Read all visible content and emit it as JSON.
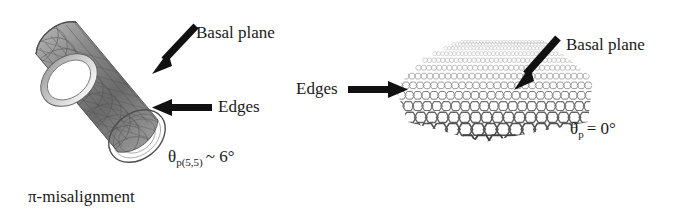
{
  "figure": {
    "background_color": "#ffffff",
    "text_color": "#1a1a1a",
    "structure_color": "#6f6f6f",
    "arrow_color": "#111111"
  },
  "left_panel": {
    "name": "carbon-nanotube-illustration",
    "structure_type": "armchair carbon nanotube (5,5) drawn as a tilted hollow cylinder with hexagonal lattice",
    "labels": {
      "basal_plane": "Basal plane",
      "edges": "Edges",
      "theta_symbol": "θ",
      "theta_subscript": "p(5,5)",
      "theta_relation": "~ 6°",
      "theta_full": "θp(5,5) ~ 6°",
      "caption": "π-misalignment"
    },
    "arrows": [
      {
        "name": "basal-plane-arrow",
        "direction": "down-left",
        "points_to": "tube wall"
      },
      {
        "name": "edges-arrow",
        "direction": "left",
        "points_to": "tube open rim"
      }
    ]
  },
  "right_panel": {
    "name": "graphene-sheet-illustration",
    "structure_type": "single graphene sheet in perspective with hexagonal lattice",
    "labels": {
      "basal_plane": "Basal plane",
      "edges": "Edges",
      "theta_symbol": "θ",
      "theta_subscript": "p",
      "theta_relation": "= 0°",
      "theta_full": "θp = 0°"
    },
    "arrows": [
      {
        "name": "basal-plane-arrow",
        "direction": "down-left",
        "points_to": "sheet surface"
      },
      {
        "name": "edges-arrow",
        "direction": "right",
        "points_to": "sheet edge"
      }
    ]
  }
}
